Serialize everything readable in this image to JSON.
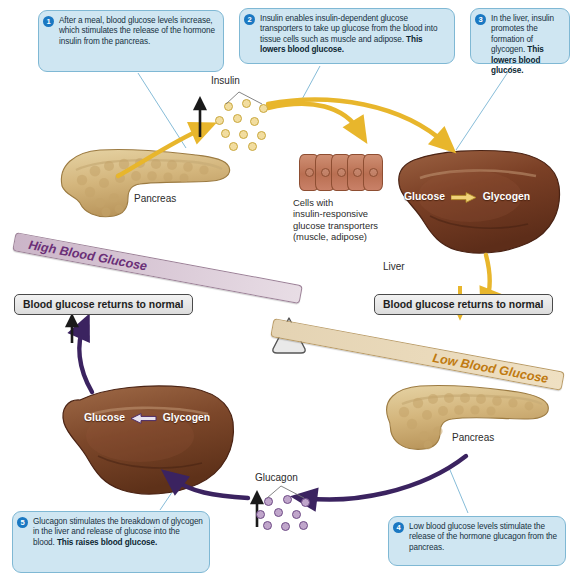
{
  "callouts": [
    {
      "number": "1",
      "text_plain": "After a meal, blood glucose levels increase, which stimulates the release of the hormone insulin from the pancreas.",
      "text_bold": ""
    },
    {
      "number": "2",
      "text_plain": "Insulin enables insulin-dependent glucose transporters to take up glucose from the blood into tissue cells such as muscle and adipose. ",
      "text_bold": "This lowers blood glucose."
    },
    {
      "number": "3",
      "text_plain": "In the liver, insulin promotes the formation of glycogen. ",
      "text_bold": "This lowers blood glucose."
    },
    {
      "number": "4",
      "text_plain": "Low blood glucose levels stimulate the release of the hormone glucagon from the pancreas.",
      "text_bold": ""
    },
    {
      "number": "5",
      "text_plain": "Glucagon stimulates the breakdown of glycogen in the liver and release of glucose into the blood. ",
      "text_bold": "This raises blood glucose."
    }
  ],
  "labels": {
    "insulin": "Insulin",
    "glucagon": "Glucagon",
    "pancreas_top": "Pancreas",
    "pancreas_bottom": "Pancreas",
    "liver": "Liver",
    "cells": "Cells with\ninsulin-responsive\nglucose transporters\n(muscle, adipose)"
  },
  "balance": {
    "bar_left": "Blood glucose returns to normal",
    "bar_right": "Blood glucose returns to normal",
    "beam_high": "High Blood Glucose",
    "beam_low": "Low Blood Glucose",
    "fulcrum": "fulcrum-triangle"
  },
  "liver_reactions": {
    "top": {
      "left": "Glucose",
      "right": "Glycogen",
      "arrow": "right-arrow-yellow"
    },
    "bottom": {
      "left": "Glucose",
      "right": "Glycogen",
      "arrow": "left-arrow-purple"
    }
  },
  "colors": {
    "insulin_pathway": "#e8b62c",
    "glucagon_pathway": "#3b2360",
    "callout_fill": "#cfe6f2",
    "callout_border": "#7fb8d4",
    "number_badge": "#1a78c2",
    "high_glucose_text": "#6b2f77",
    "low_glucose_text": "#c07a10",
    "liver_body": "#7a442a",
    "pancreas_body": "#d8bd86",
    "cell_body": "#bf7454"
  }
}
